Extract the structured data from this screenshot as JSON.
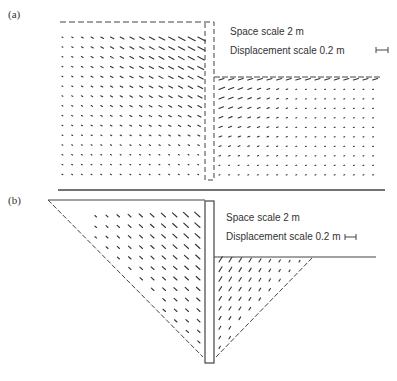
{
  "panels": [
    {
      "id": "a",
      "label": "(a)",
      "space_scale": "Space scale 2 m",
      "displacement_scale": "Displacement scale 0.2 m",
      "wall": {
        "style": "dashed",
        "x": 205,
        "y1": 22,
        "y2": 180,
        "width": 9
      },
      "retained_surface_y": 22,
      "excavated_surface_y": 77,
      "base_line_y": 190
    },
    {
      "id": "b",
      "label": "(b)",
      "space_scale": "Space scale 2 m",
      "displacement_scale": "Displacement scale 0.2 m",
      "wall": {
        "style": "solid",
        "x": 205,
        "y1": 201,
        "y2": 363,
        "width": 9
      },
      "retained_surface_y": 200,
      "excavated_surface_y": 257,
      "failure_wedges": "dashed triangular zones on both sides of wall"
    }
  ],
  "colors": {
    "line": "#444444",
    "vector": "#333333",
    "background": "#ffffff"
  }
}
